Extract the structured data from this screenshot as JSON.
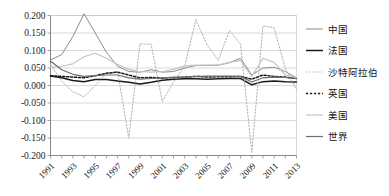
{
  "chart_data": {
    "type": "line",
    "title": "",
    "subtitle": "",
    "xlabel": "",
    "ylabel": "",
    "xlim": [
      1991,
      2013
    ],
    "ylim": [
      -0.2,
      0.2
    ],
    "grid": true,
    "legend_position": "right",
    "y_ticks": [
      "0.200",
      "0.150",
      "0.100",
      "0.050",
      "0.000",
      "-0.050",
      "-0.100",
      "-0.150",
      "-0.200"
    ],
    "y_tick_values": [
      0.2,
      0.15,
      0.1,
      0.05,
      0.0,
      -0.05,
      -0.1,
      -0.15,
      -0.2
    ],
    "x_ticks": [
      "1991",
      "1993",
      "1995",
      "1997",
      "1999",
      "2001",
      "2003",
      "2005",
      "2007",
      "2009",
      "2011",
      "2013"
    ],
    "x_tick_values": [
      1991,
      1993,
      1995,
      1997,
      1999,
      2001,
      2003,
      2005,
      2007,
      2009,
      2011,
      2013
    ],
    "x": [
      1991,
      1992,
      1993,
      1994,
      1995,
      1996,
      1997,
      1998,
      1999,
      2000,
      2001,
      2002,
      2003,
      2004,
      2005,
      2006,
      2007,
      2008,
      2009,
      2010,
      2011,
      2012,
      2013
    ],
    "series": [
      {
        "name": "中国",
        "color": "#8c8c8c",
        "width": 1.0,
        "dash": "none",
        "values": [
          0.073,
          0.088,
          0.14,
          0.205,
          0.15,
          0.095,
          0.055,
          0.04,
          0.038,
          0.045,
          0.038,
          0.04,
          0.05,
          0.057,
          0.057,
          0.058,
          0.065,
          0.078,
          0.03,
          0.05,
          0.052,
          0.04,
          0.022
        ]
      },
      {
        "name": "法国",
        "color": "#1a1a1a",
        "width": 1.5,
        "dash": "none",
        "values": [
          0.027,
          0.022,
          0.014,
          0.011,
          0.017,
          0.017,
          0.013,
          0.009,
          0.004,
          0.009,
          0.015,
          0.018,
          0.019,
          0.019,
          0.018,
          0.019,
          0.02,
          0.02,
          0.002,
          0.011,
          0.013,
          0.011,
          0.01
        ]
      },
      {
        "name": "沙特阿拉伯",
        "color": "#b0b0b0",
        "width": 1.0,
        "dash": "1.5,1.8",
        "values": [
          0.06,
          0.012,
          -0.018,
          -0.032,
          0.0,
          0.035,
          0.04,
          -0.15,
          0.119,
          0.118,
          -0.046,
          0.01,
          0.055,
          0.188,
          0.116,
          0.072,
          0.157,
          0.118,
          -0.191,
          0.17,
          0.165,
          0.049,
          -0.012
        ]
      },
      {
        "name": "英国",
        "color": "#1a1a1a",
        "width": 1.5,
        "dash": "2.2,1.8",
        "values": [
          0.028,
          0.026,
          0.024,
          0.022,
          0.028,
          0.035,
          0.038,
          0.03,
          0.022,
          0.023,
          0.021,
          0.023,
          0.024,
          0.026,
          0.024,
          0.025,
          0.025,
          0.026,
          0.018,
          0.03,
          0.026,
          0.024,
          0.02
        ]
      },
      {
        "name": "美国",
        "color": "#c4c4c4",
        "width": 1.2,
        "dash": "none",
        "values": [
          0.052,
          0.055,
          0.062,
          0.082,
          0.092,
          0.078,
          0.06,
          0.046,
          0.04,
          0.038,
          0.04,
          0.046,
          0.056,
          0.058,
          0.058,
          0.058,
          0.066,
          0.072,
          0.026,
          0.078,
          0.066,
          0.03,
          0.022
        ]
      },
      {
        "name": "世界",
        "color": "#6e6e6e",
        "width": 1.2,
        "dash": "none",
        "values": [
          0.07,
          0.045,
          0.032,
          0.026,
          0.028,
          0.03,
          0.03,
          0.022,
          0.018,
          0.02,
          0.022,
          0.023,
          0.023,
          0.026,
          0.027,
          0.027,
          0.027,
          0.026,
          0.01,
          0.022,
          0.024,
          0.023,
          0.02
        ]
      }
    ]
  },
  "legend": {
    "items": [
      {
        "label": "中国"
      },
      {
        "label": "法国"
      },
      {
        "label": "沙特阿拉伯"
      },
      {
        "label": "英国"
      },
      {
        "label": "美国"
      },
      {
        "label": "世界"
      }
    ]
  },
  "colors": {
    "grid": "#c8c8c8",
    "axis": "#8a8a8a",
    "text": "#1a1a1a",
    "background": "#ffffff"
  }
}
